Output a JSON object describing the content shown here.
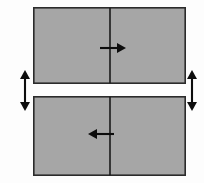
{
  "figure": {
    "background_color": "#fdfdfd",
    "block_fill_color": "#a6a6a6",
    "block_border_color": "#2b2b2b",
    "arrow_color": "#0d0d0d",
    "canvas": {
      "width": 204,
      "height": 183
    }
  },
  "blocks": [
    {
      "id": "top-block",
      "label": "",
      "x": 33,
      "y": 7,
      "width": 153,
      "height": 77,
      "divider_x": 110,
      "description": "upper rectangular block divided vertically at center"
    },
    {
      "id": "bottom-block",
      "label": "",
      "x": 33,
      "y": 96,
      "width": 153,
      "height": 80,
      "divider_x": 110,
      "description": "lower rectangular block divided vertically at center"
    }
  ],
  "arrows": [
    {
      "id": "top-shear-arrow",
      "direction": "right",
      "label": "",
      "x1": 100,
      "x2": 126,
      "y": 48,
      "head_length": 9,
      "head_half_width": 5,
      "description": "rightward shear arrow inside the upper block"
    },
    {
      "id": "bottom-shear-arrow",
      "direction": "left",
      "label": "",
      "x1": 114,
      "x2": 88,
      "y": 134,
      "head_length": 9,
      "head_half_width": 5,
      "description": "leftward shear arrow inside the lower block"
    }
  ],
  "double_arrows": [
    {
      "id": "left-gap-arrow",
      "orientation": "vertical",
      "label": "",
      "x": 25,
      "y_top": 70,
      "y_bottom": 111,
      "head_length": 9,
      "head_half_width": 5,
      "description": "double-headed vertical arrow on the left indicating separation"
    },
    {
      "id": "right-gap-arrow",
      "orientation": "vertical",
      "label": "",
      "x": 192,
      "y_top": 70,
      "y_bottom": 111,
      "head_length": 9,
      "head_half_width": 5,
      "description": "double-headed vertical arrow on the right indicating separation"
    }
  ],
  "gap": {
    "id": "separation-gap",
    "label": "",
    "y_top": 84,
    "y_bottom": 96,
    "description": "white horizontal gap between the two blocks"
  }
}
